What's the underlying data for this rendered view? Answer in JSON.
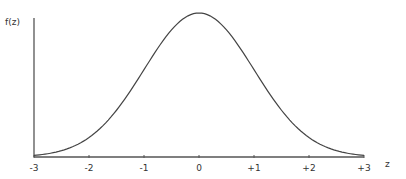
{
  "chart_data": {
    "type": "line",
    "title": "",
    "xlabel": "z",
    "ylabel": "f(z)",
    "xlim": [
      -3,
      3
    ],
    "ylim": [
      0,
      0.4
    ],
    "grid": false,
    "legend": null,
    "x_tick_labels": [
      "-3",
      "-2",
      "-1",
      "0",
      "+1",
      "+2",
      "+3"
    ],
    "x_ticks": [
      -3,
      -2,
      -1,
      0,
      1,
      2,
      3
    ],
    "series": [
      {
        "name": "standard normal density f(z)",
        "x": [
          -3,
          -2.5,
          -2,
          -1.5,
          -1,
          -0.5,
          0,
          0.5,
          1,
          1.5,
          2,
          2.5,
          3
        ],
        "values": [
          0.0044,
          0.0175,
          0.054,
          0.1295,
          0.242,
          0.3521,
          0.3989,
          0.3521,
          0.242,
          0.1295,
          0.054,
          0.0175,
          0.0044
        ]
      }
    ]
  },
  "colors": {
    "axis": "#555555",
    "curve": "#444444",
    "text": "#333333"
  }
}
